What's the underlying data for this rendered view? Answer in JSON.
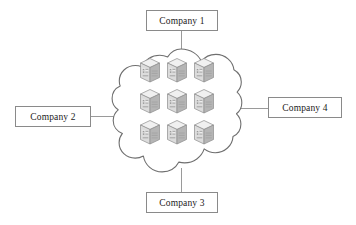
{
  "diagram": {
    "background_color": "#ffffff",
    "cloud": {
      "name": "cloud",
      "fill": "#ffffff",
      "stroke": "#6f6f6f",
      "bounds": {
        "x": 122,
        "y": 49,
        "width": 119,
        "height": 123
      }
    },
    "servers": {
      "count": 9,
      "rows": 3,
      "columns": 3,
      "icon_name": "server-icon",
      "body_fill": "#d8d8d8",
      "top_fill": "#efefef",
      "side_fill": "#b9b9b9",
      "stroke": "#8d8d8d",
      "positions": [
        {
          "x": 150,
          "y": 70
        },
        {
          "x": 177,
          "y": 70
        },
        {
          "x": 204,
          "y": 70
        },
        {
          "x": 150,
          "y": 101
        },
        {
          "x": 177,
          "y": 101
        },
        {
          "x": 204,
          "y": 101
        },
        {
          "x": 150,
          "y": 132
        },
        {
          "x": 177,
          "y": 132
        },
        {
          "x": 204,
          "y": 132
        }
      ]
    },
    "boxes": [
      {
        "id": "company-1",
        "label": "Company 1",
        "x": 146,
        "y": 10,
        "width": 72,
        "height": 21,
        "position": "top"
      },
      {
        "id": "company-2",
        "label": "Company 2",
        "x": 15,
        "y": 106,
        "width": 76,
        "height": 21,
        "position": "left"
      },
      {
        "id": "company-3",
        "label": "Company 3",
        "x": 146,
        "y": 192,
        "width": 72,
        "height": 21,
        "position": "bottom"
      },
      {
        "id": "company-4",
        "label": "Company 4",
        "x": 268,
        "y": 97,
        "width": 74,
        "height": 21,
        "position": "right"
      }
    ],
    "connectors": [
      {
        "id": "connector-company-1",
        "orientation": "v",
        "x": 181,
        "y": 31,
        "length": 24,
        "color": "#9a9a9a"
      },
      {
        "id": "connector-company-2",
        "orientation": "h",
        "x": 91,
        "y": 116,
        "length": 33,
        "color": "#9a9a9a"
      },
      {
        "id": "connector-company-3",
        "orientation": "v",
        "x": 181,
        "y": 168,
        "length": 24,
        "color": "#9a9a9a"
      },
      {
        "id": "connector-company-4",
        "orientation": "h",
        "x": 239,
        "y": 108,
        "length": 29,
        "color": "#9a9a9a"
      }
    ]
  }
}
